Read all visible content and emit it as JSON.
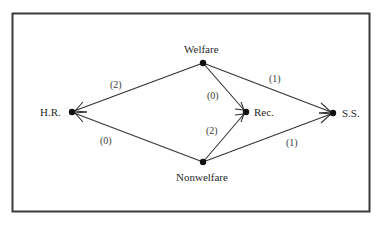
{
  "diagram": {
    "type": "directed-graph",
    "frame": {
      "border_color": "#3a3a3a"
    },
    "nodes": [
      {
        "id": "welfare",
        "label": "Welfare"
      },
      {
        "id": "nonwelfare",
        "label": "Nonwelfare"
      },
      {
        "id": "hr",
        "label": "H.R."
      },
      {
        "id": "rec",
        "label": "Rec."
      },
      {
        "id": "ss",
        "label": "S.S."
      }
    ],
    "edges": [
      {
        "from": "welfare",
        "to": "hr",
        "label": "(2)"
      },
      {
        "from": "welfare",
        "to": "rec",
        "label": "(0)"
      },
      {
        "from": "welfare",
        "to": "ss",
        "label": "(1)"
      },
      {
        "from": "nonwelfare",
        "to": "hr",
        "label": "(0)"
      },
      {
        "from": "nonwelfare",
        "to": "rec",
        "label": "(2)"
      },
      {
        "from": "nonwelfare",
        "to": "ss",
        "label": "(1)"
      }
    ]
  }
}
